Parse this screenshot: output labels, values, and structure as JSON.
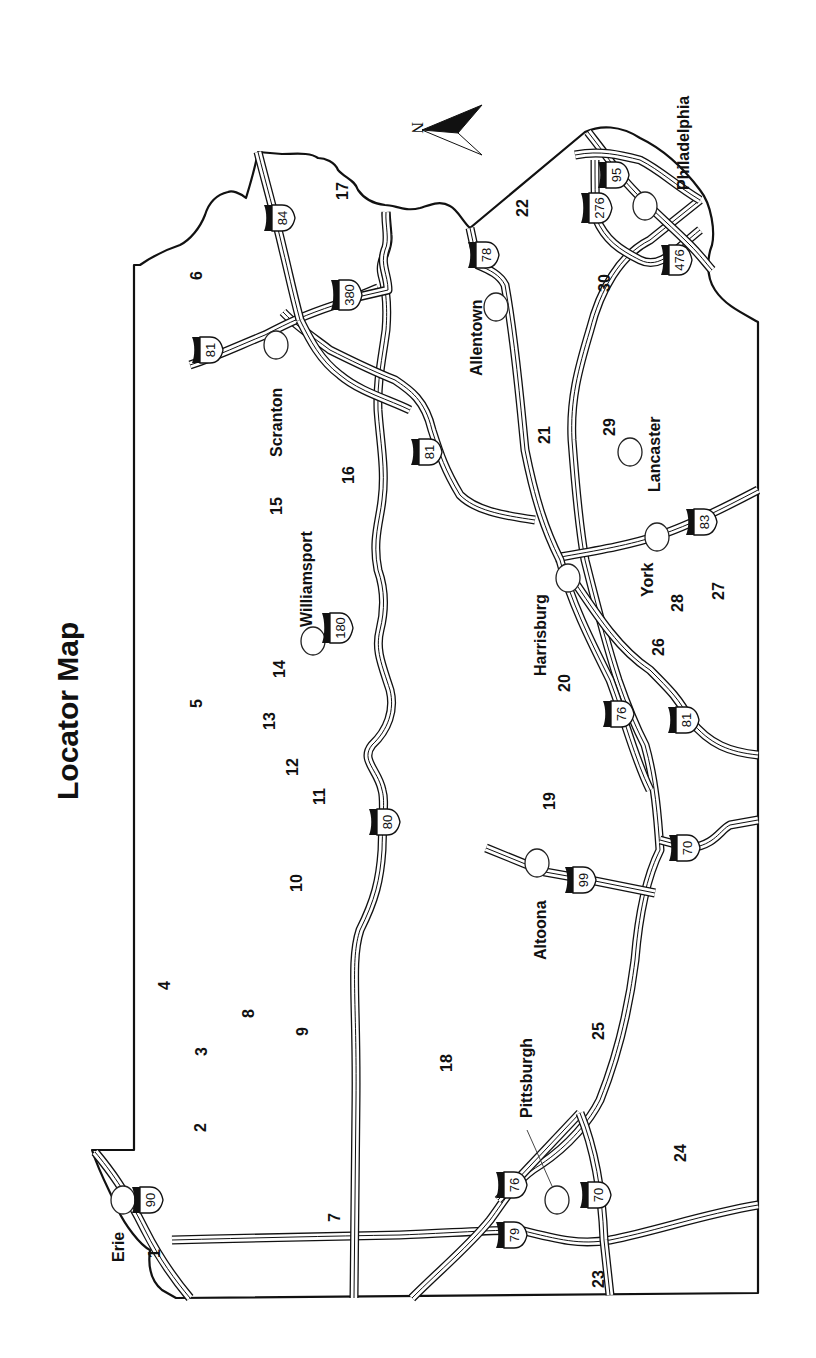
{
  "title": "Locator Map",
  "compass": {
    "label": "N"
  },
  "cities": [
    {
      "id": "erie",
      "name": "Erie"
    },
    {
      "id": "pittsburgh",
      "name": "Pittsburgh"
    },
    {
      "id": "altoona",
      "name": "Altoona"
    },
    {
      "id": "williamsport",
      "name": "Williamsport"
    },
    {
      "id": "scranton",
      "name": "Scranton"
    },
    {
      "id": "allentown",
      "name": "Allentown"
    },
    {
      "id": "harrisburg",
      "name": "Harrisburg"
    },
    {
      "id": "york",
      "name": "York"
    },
    {
      "id": "lancaster",
      "name": "Lancaster"
    },
    {
      "id": "philadelphia",
      "name": "Philadelphia"
    }
  ],
  "interstates": [
    {
      "id": "i90",
      "number": "90"
    },
    {
      "id": "i79",
      "number": "79"
    },
    {
      "id": "i76_west",
      "number": "76"
    },
    {
      "id": "i70_west",
      "number": "70"
    },
    {
      "id": "i80",
      "number": "80"
    },
    {
      "id": "i99",
      "number": "99"
    },
    {
      "id": "i70_east",
      "number": "70"
    },
    {
      "id": "i180",
      "number": "180"
    },
    {
      "id": "i76_east",
      "number": "76"
    },
    {
      "id": "i81_south",
      "number": "81"
    },
    {
      "id": "i81_central",
      "number": "81"
    },
    {
      "id": "i83",
      "number": "83"
    },
    {
      "id": "i81_north",
      "number": "81"
    },
    {
      "id": "i380",
      "number": "380"
    },
    {
      "id": "i84",
      "number": "84"
    },
    {
      "id": "i78",
      "number": "78"
    },
    {
      "id": "i276",
      "number": "276"
    },
    {
      "id": "i95",
      "number": "95"
    },
    {
      "id": "i476",
      "number": "476"
    }
  ],
  "regions": [
    "1",
    "2",
    "3",
    "4",
    "5",
    "6",
    "7",
    "8",
    "9",
    "10",
    "11",
    "12",
    "13",
    "14",
    "15",
    "16",
    "17",
    "18",
    "19",
    "20",
    "21",
    "22",
    "23",
    "24",
    "25",
    "26",
    "27",
    "28",
    "29",
    "30"
  ],
  "colors": {
    "ink": "#111111",
    "paper": "#ffffff"
  }
}
